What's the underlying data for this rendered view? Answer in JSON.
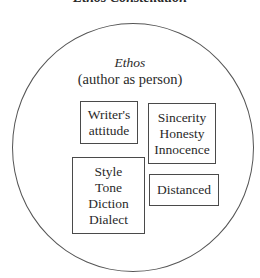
{
  "title": "Ethos Constellation",
  "circle": {
    "name": "Ethos",
    "subtitle": "(author as person)"
  },
  "boxes": [
    {
      "id": "writer",
      "lines": [
        "Writer's",
        "attitude"
      ]
    },
    {
      "id": "sincerity",
      "lines": [
        "Sincerity",
        "Honesty",
        "Innocence"
      ]
    },
    {
      "id": "style",
      "lines": [
        "Style",
        "Tone",
        "Diction",
        "Dialect"
      ]
    },
    {
      "id": "distanced",
      "lines": [
        "Distanced"
      ]
    }
  ],
  "colors": {
    "stroke": "#555555",
    "text": "#2a2a2a",
    "background": "#ffffff"
  }
}
